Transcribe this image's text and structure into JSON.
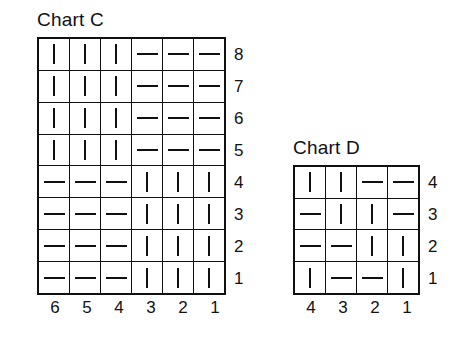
{
  "charts": [
    {
      "id": "chart-c",
      "title": "Chart C",
      "column_labels": [
        "6",
        "5",
        "4",
        "3",
        "2",
        "1"
      ],
      "row_labels": [
        "8",
        "7",
        "6",
        "5",
        "4",
        "3",
        "2",
        "1"
      ],
      "symbols": {
        "knit": "vertical-bar",
        "purl": "horizontal-dash"
      },
      "rows": [
        {
          "label": "8",
          "cells": [
            "knit",
            "knit",
            "knit",
            "purl",
            "purl",
            "purl"
          ]
        },
        {
          "label": "7",
          "cells": [
            "knit",
            "knit",
            "knit",
            "purl",
            "purl",
            "purl"
          ]
        },
        {
          "label": "6",
          "cells": [
            "knit",
            "knit",
            "knit",
            "purl",
            "purl",
            "purl"
          ]
        },
        {
          "label": "5",
          "cells": [
            "knit",
            "knit",
            "knit",
            "purl",
            "purl",
            "purl"
          ]
        },
        {
          "label": "4",
          "cells": [
            "purl",
            "purl",
            "purl",
            "knit",
            "knit",
            "knit"
          ]
        },
        {
          "label": "3",
          "cells": [
            "purl",
            "purl",
            "purl",
            "knit",
            "knit",
            "knit"
          ]
        },
        {
          "label": "2",
          "cells": [
            "purl",
            "purl",
            "purl",
            "knit",
            "knit",
            "knit"
          ]
        },
        {
          "label": "1",
          "cells": [
            "purl",
            "purl",
            "purl",
            "knit",
            "knit",
            "knit"
          ]
        }
      ]
    },
    {
      "id": "chart-d",
      "title": "Chart D",
      "column_labels": [
        "4",
        "3",
        "2",
        "1"
      ],
      "row_labels": [
        "4",
        "3",
        "2",
        "1"
      ],
      "symbols": {
        "knit": "vertical-bar",
        "purl": "horizontal-dash"
      },
      "rows": [
        {
          "label": "4",
          "cells": [
            "knit",
            "knit",
            "purl",
            "purl"
          ]
        },
        {
          "label": "3",
          "cells": [
            "purl",
            "knit",
            "knit",
            "purl"
          ]
        },
        {
          "label": "2",
          "cells": [
            "purl",
            "purl",
            "knit",
            "knit"
          ]
        },
        {
          "label": "1",
          "cells": [
            "knit",
            "purl",
            "purl",
            "knit"
          ]
        }
      ]
    }
  ],
  "chart_data": {
    "type": "table",
    "xlabel": "",
    "ylabel": "",
    "grid": true,
    "legend": "none",
    "charts": [
      {
        "name": "Chart C",
        "columns": 6,
        "rows": 8,
        "column_labels": [
          "6",
          "5",
          "4",
          "3",
          "2",
          "1"
        ],
        "row_labels_bottom_to_top": [
          "1",
          "2",
          "3",
          "4",
          "5",
          "6",
          "7",
          "8"
        ],
        "matrix_top_to_bottom": [
          [
            "knit",
            "knit",
            "knit",
            "purl",
            "purl",
            "purl"
          ],
          [
            "knit",
            "knit",
            "knit",
            "purl",
            "purl",
            "purl"
          ],
          [
            "knit",
            "knit",
            "knit",
            "purl",
            "purl",
            "purl"
          ],
          [
            "knit",
            "knit",
            "knit",
            "purl",
            "purl",
            "purl"
          ],
          [
            "purl",
            "purl",
            "purl",
            "knit",
            "knit",
            "knit"
          ],
          [
            "purl",
            "purl",
            "purl",
            "knit",
            "knit",
            "knit"
          ],
          [
            "purl",
            "purl",
            "purl",
            "knit",
            "knit",
            "knit"
          ],
          [
            "purl",
            "purl",
            "purl",
            "knit",
            "knit",
            "knit"
          ]
        ]
      },
      {
        "name": "Chart D",
        "columns": 4,
        "rows": 4,
        "column_labels": [
          "4",
          "3",
          "2",
          "1"
        ],
        "row_labels_bottom_to_top": [
          "1",
          "2",
          "3",
          "4"
        ],
        "matrix_top_to_bottom": [
          [
            "knit",
            "knit",
            "purl",
            "purl"
          ],
          [
            "purl",
            "knit",
            "knit",
            "purl"
          ],
          [
            "purl",
            "purl",
            "knit",
            "knit"
          ],
          [
            "knit",
            "purl",
            "purl",
            "knit"
          ]
        ]
      }
    ]
  }
}
